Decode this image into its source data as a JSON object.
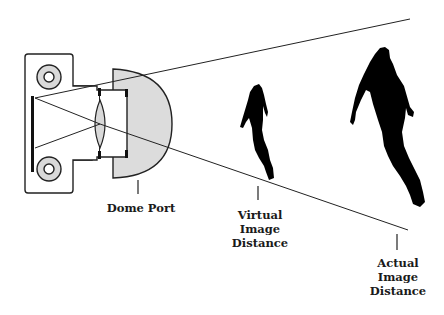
{
  "diagram": {
    "colors": {
      "line": "#222222",
      "fill_gray": "#d9d9d9",
      "silhouette": "#000000",
      "background": "#ffffff"
    },
    "components": [
      {
        "id": "camera-body",
        "label": ""
      },
      {
        "id": "lens",
        "label": ""
      },
      {
        "id": "dome-port",
        "label": "Dome Port"
      },
      {
        "id": "virtual-diver",
        "label": ""
      },
      {
        "id": "actual-diver",
        "label": ""
      }
    ],
    "labels": {
      "dome_port": "Dome Port",
      "virtual": {
        "line1": "Virtual",
        "line2": "Image",
        "line3": "Distance"
      },
      "actual": {
        "line1": "Actual",
        "line2": "Image",
        "line3": "Distance"
      }
    }
  }
}
